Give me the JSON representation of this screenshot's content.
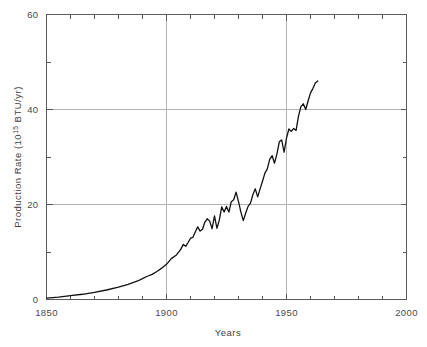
{
  "chart_data": {
    "type": "line",
    "title": "",
    "xlabel": "Years",
    "ylabel": "Production Rate (10¹⁵ BTU/yr)",
    "ylabel_main": "Production Rate (10",
    "ylabel_exp": "15",
    "ylabel_tail": " BTU/yr)",
    "xlim": [
      1850,
      2000
    ],
    "ylim": [
      0,
      60
    ],
    "grid": "major gridlines at x=1900,1950 and y=20,40",
    "legend": "none",
    "x_major_ticks": [
      1850,
      1900,
      1950,
      2000
    ],
    "x_major_tick_labels": [
      "1850",
      "1900",
      "1950",
      "2000"
    ],
    "x_minor_tick_interval": 10,
    "y_major_ticks": [
      0,
      20,
      40,
      60
    ],
    "y_major_tick_labels": [
      "0",
      "20",
      "40",
      "60"
    ],
    "y_minor_tick_interval": 10,
    "series": [
      {
        "name": "World energy production rate",
        "x": [
          1850,
          1855,
          1860,
          1865,
          1870,
          1875,
          1880,
          1884,
          1888,
          1890,
          1892,
          1894,
          1896,
          1898,
          1900,
          1902,
          1904,
          1906,
          1907,
          1908,
          1909,
          1910,
          1911,
          1912,
          1913,
          1914,
          1915,
          1916,
          1917,
          1918,
          1919,
          1920,
          1921,
          1922,
          1923,
          1924,
          1925,
          1926,
          1927,
          1928,
          1929,
          1930,
          1931,
          1932,
          1933,
          1934,
          1935,
          1936,
          1937,
          1938,
          1939,
          1940,
          1941,
          1942,
          1943,
          1944,
          1945,
          1946,
          1947,
          1948,
          1949,
          1950,
          1951,
          1952,
          1953,
          1954,
          1955,
          1956,
          1957,
          1958,
          1959,
          1960,
          1961,
          1962,
          1963
        ],
        "y": [
          0.3,
          0.5,
          0.8,
          1.1,
          1.5,
          2.0,
          2.6,
          3.2,
          3.9,
          4.4,
          4.9,
          5.3,
          5.9,
          6.6,
          7.4,
          8.6,
          9.3,
          10.6,
          11.6,
          11.2,
          12.0,
          12.9,
          13.1,
          14.2,
          15.3,
          14.4,
          14.8,
          16.3,
          17.0,
          16.5,
          14.9,
          17.6,
          15.0,
          16.7,
          19.5,
          18.4,
          19.6,
          18.4,
          20.6,
          21.0,
          22.6,
          20.6,
          18.4,
          16.6,
          18.2,
          19.6,
          20.3,
          22.1,
          23.3,
          21.6,
          23.3,
          24.9,
          26.6,
          27.5,
          29.5,
          30.3,
          28.7,
          30.6,
          33.2,
          33.6,
          31.0,
          34.0,
          35.9,
          35.4,
          36.0,
          35.6,
          38.6,
          40.6,
          41.2,
          40.0,
          41.8,
          43.5,
          44.4,
          45.6,
          46.0
        ]
      }
    ]
  },
  "axis": {
    "x_title": "Years",
    "y_title_main": "Production Rate (10",
    "y_title_exp": "15",
    "y_title_tail": " BTU/yr)"
  },
  "ticks": {
    "x": [
      "1850",
      "1900",
      "1950",
      "2000"
    ],
    "y": [
      "0",
      "20",
      "40",
      "60"
    ]
  },
  "colors": {
    "background": "#ffffff",
    "series": "#111111",
    "frame": "#5a5a5a",
    "grid": "#b3b3b3",
    "text": "#3f3f3f"
  }
}
